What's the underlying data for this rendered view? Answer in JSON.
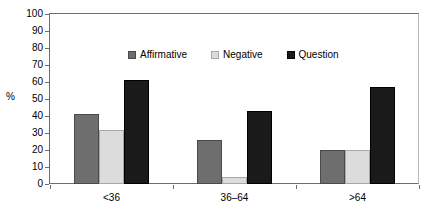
{
  "chart_data": {
    "type": "bar",
    "title": "",
    "subtitle": "",
    "xlabel": "",
    "ylabel": "%",
    "categories": [
      "<36",
      "36–64",
      ">64"
    ],
    "series": [
      {
        "name": "Affirmative",
        "color": "#6e6e6e",
        "values": [
          41,
          26,
          20
        ]
      },
      {
        "name": "Negative",
        "color": "#dcdcdc",
        "values": [
          32,
          4,
          20
        ]
      },
      {
        "name": "Question",
        "color": "#1a1a1a",
        "values": [
          61,
          43,
          57
        ]
      }
    ],
    "ylim": [
      0,
      100
    ],
    "yticks": [
      0,
      10,
      20,
      30,
      40,
      50,
      60,
      70,
      80,
      90,
      100
    ],
    "ytick_labels": [
      "0",
      "10",
      "20",
      "30",
      "40",
      "50",
      "60",
      "70",
      "80",
      "90",
      "100"
    ],
    "grid": false,
    "legend_position": "upper-center-inside",
    "annotations": []
  },
  "axis": {
    "y_title": "%",
    "y_labels": [
      "100",
      "90",
      "80",
      "70",
      "60",
      "50",
      "40",
      "30",
      "20",
      "10",
      "0"
    ],
    "x_labels": [
      "<36",
      "36–64",
      ">64"
    ]
  },
  "legend": {
    "entries": [
      {
        "label": "Affirmative",
        "swatch": "affirmative-swatch-icon"
      },
      {
        "label": "Negative",
        "swatch": "negative-swatch-icon"
      },
      {
        "label": "Question",
        "swatch": "question-swatch-icon"
      }
    ]
  }
}
